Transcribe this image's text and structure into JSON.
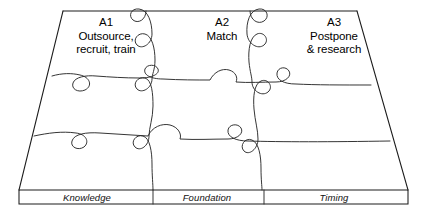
{
  "figure": {
    "type": "jigsaw-puzzle-diagram",
    "shape": "trapezoid-perspective",
    "grid_rows": 3,
    "grid_columns": 3,
    "line_color": "#1c1c1c",
    "background_color": "#ffffff"
  },
  "pieces": [
    {
      "code": "A1",
      "description_line1": "Outsource,",
      "description_line2": "recruit, train"
    },
    {
      "code": "A2",
      "description_line1": "Match",
      "description_line2": ""
    },
    {
      "code": "A3",
      "description_line1": "Postpone",
      "description_line2": "& research"
    }
  ],
  "base_band": {
    "labels": [
      {
        "text": "Knowledge"
      },
      {
        "text": "Foundation"
      },
      {
        "text": "Timing"
      }
    ]
  }
}
